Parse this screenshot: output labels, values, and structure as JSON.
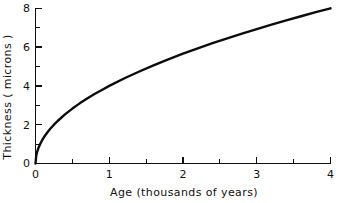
{
  "figure": {
    "background_color": "#ffffff",
    "ink_color": "#111111"
  },
  "chart_data": {
    "type": "line",
    "title": "",
    "subtitle": "",
    "xlabel": "Age (thousands of years)",
    "ylabel": "Thickness ( microns )",
    "xlim": [
      0,
      4
    ],
    "ylim": [
      0,
      8
    ],
    "grid": false,
    "legend": false,
    "legend_position": "none",
    "x_ticks_major": [
      0,
      1,
      2,
      3,
      4
    ],
    "x_ticks_major_labels": [
      "0",
      "1",
      "2",
      "3",
      "4"
    ],
    "x_ticks_minor": [
      0.5,
      1.5,
      2.5,
      3.5
    ],
    "y_ticks_major": [
      0,
      2,
      4,
      6,
      8
    ],
    "y_ticks_major_labels": [
      "0",
      "2",
      "4",
      "6",
      "8"
    ],
    "y_ticks_minor": [
      1,
      3,
      5,
      7
    ],
    "curve_relation": "thickness = 4 * sqrt(age)",
    "series": [
      {
        "name": "Weathering rind thickness",
        "color": "#0c0c0c",
        "x": [
          0,
          0.01,
          0.02,
          0.04,
          0.06,
          0.09,
          0.12,
          0.16,
          0.2,
          0.25,
          0.3,
          0.4,
          0.5,
          0.6,
          0.7,
          0.8,
          0.9,
          1.0,
          1.2,
          1.4,
          1.6,
          1.8,
          2.0,
          2.2,
          2.4,
          2.6,
          2.8,
          3.0,
          3.2,
          3.4,
          3.6,
          3.8,
          4.0
        ],
        "y": [
          0.0,
          0.4,
          0.57,
          0.8,
          0.98,
          1.2,
          1.39,
          1.6,
          1.79,
          2.0,
          2.19,
          2.53,
          2.83,
          3.1,
          3.35,
          3.58,
          3.79,
          4.0,
          4.38,
          4.73,
          5.06,
          5.37,
          5.66,
          5.93,
          6.2,
          6.45,
          6.69,
          6.93,
          7.16,
          7.38,
          7.59,
          7.8,
          8.0
        ]
      }
    ]
  },
  "axes": {
    "x_tick_labels": [
      "0",
      "1",
      "2",
      "3",
      "4"
    ],
    "y_tick_labels": [
      "0",
      "2",
      "4",
      "6",
      "8"
    ],
    "x_axis_title": "Age (thousands of years)",
    "y_axis_title": "Thickness ( microns )"
  }
}
